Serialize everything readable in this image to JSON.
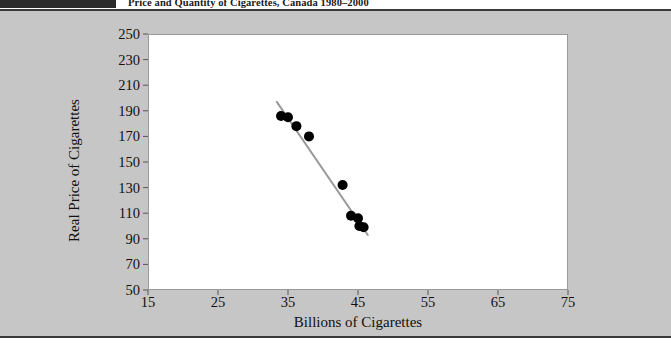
{
  "header": {
    "title": "Price and Quantity of Cigarettes, Canada 1980–2000",
    "dark_block": ""
  },
  "chart_data": {
    "type": "scatter",
    "title": "Price and Quantity of Cigarettes, Canada 1980–2000",
    "xlabel": "Billions of Cigarettes",
    "ylabel": "Real Price of Cigarettes",
    "xlim": [
      15,
      75
    ],
    "ylim": [
      50,
      250
    ],
    "xticks": [
      15,
      25,
      35,
      45,
      55,
      65,
      75
    ],
    "yticks": [
      50,
      70,
      90,
      110,
      130,
      150,
      170,
      190,
      210,
      230,
      250
    ],
    "grid": false,
    "legend": null,
    "marker_color": "#000000",
    "marker_size": 5,
    "points": [
      {
        "x": 34.0,
        "y": 186
      },
      {
        "x": 35.0,
        "y": 185
      },
      {
        "x": 36.2,
        "y": 178
      },
      {
        "x": 38.0,
        "y": 170
      },
      {
        "x": 42.8,
        "y": 132
      },
      {
        "x": 44.0,
        "y": 108
      },
      {
        "x": 45.0,
        "y": 106
      },
      {
        "x": 45.2,
        "y": 100
      },
      {
        "x": 45.8,
        "y": 99
      }
    ],
    "trendline": {
      "type": "linear-fit",
      "color": "#9a9a9a",
      "width": 2,
      "x_start": 33.4,
      "y_start": 197,
      "x_end": 46.4,
      "y_end": 93
    }
  }
}
